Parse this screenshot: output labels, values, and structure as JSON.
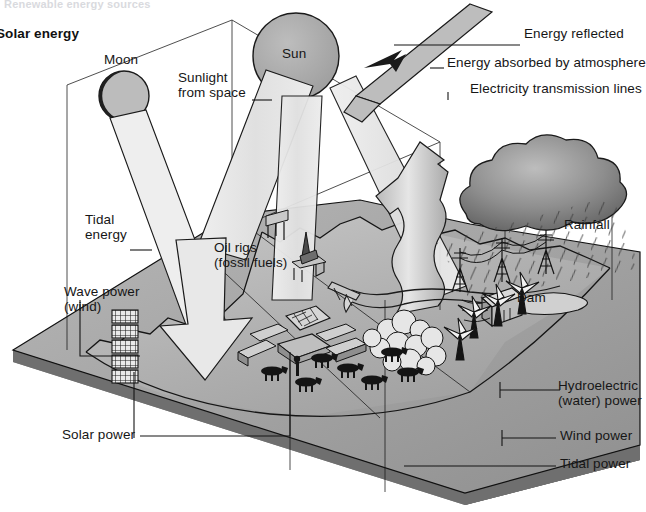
{
  "page": {
    "ghost_title": "Renewable energy sources",
    "section_title": "Solar energy",
    "background_color": "#ffffff",
    "ink_color": "#161616"
  },
  "celestial": {
    "sun_label": "Sun",
    "moon_label": "Moon",
    "sun_fill": "#a8a8a8",
    "moon_light_fill": "#c0c0c0",
    "moon_shadow_fill": "#1f1f1f"
  },
  "labels": {
    "sunlight_from_space": "Sunlight\nfrom space",
    "energy_reflected": "Energy reflected",
    "energy_absorbed": "Energy absorbed by atmosphere",
    "electricity_lines": "Electricity transmission lines",
    "tidal_energy": "Tidal\nenergy",
    "wave_power": "Wave power\n(wind)",
    "oil_rigs": "Oil rigs\n(fossil fuels)",
    "rainfall": "Rainfall",
    "dam": "Dam",
    "solar_power": "Solar power",
    "hydroelectric_power": "Hydroelectric\n(water) power",
    "wind_power": "Wind power",
    "tidal_power": "Tidal power"
  },
  "scene": {
    "block_top_fill": "#b4b4b4",
    "block_front_fill": "#8e8e8e",
    "block_right_fill": "#202020",
    "sea_fill": "#9a9a9a",
    "beam_fill": "#e4e4e4",
    "cloud_fill": "#8d8d8d",
    "arrow_fill": "#cfcfcf"
  },
  "features": {
    "solar_array": "solar-panel-array",
    "wind_turbines": "wind-turbines",
    "wave_devices": "wave-power-devices",
    "pylons": "transmission-pylons",
    "cattle": "cattle-herd",
    "trees": "tree-cluster",
    "river": "river",
    "bridge": "bridge",
    "oil_rig": "oil-rig",
    "rain_cloud": "rain-cloud",
    "evaporation_arrow": "evaporation-arrow",
    "reflected_beam": "reflected-sunlight-beam"
  }
}
